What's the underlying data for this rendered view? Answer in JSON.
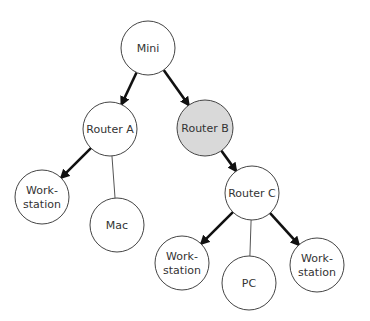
{
  "diagram": {
    "type": "network-tree",
    "colors": {
      "node_fill": "#ffffff",
      "highlight_fill": "#d9d9d9",
      "stroke": "#444444",
      "bold_edge": "#111111",
      "thin_edge": "#555555"
    },
    "nodes": [
      {
        "id": "mini",
        "lines": [
          "Mini"
        ],
        "cx": 148,
        "cy": 48,
        "r": 27,
        "highlight": false
      },
      {
        "id": "router-a",
        "lines": [
          "Router A"
        ],
        "cx": 110,
        "cy": 129,
        "r": 27,
        "highlight": false
      },
      {
        "id": "router-b",
        "lines": [
          "Router B"
        ],
        "cx": 205,
        "cy": 128,
        "r": 28,
        "highlight": true
      },
      {
        "id": "workstation-1",
        "lines": [
          "Work-",
          "station"
        ],
        "cx": 42,
        "cy": 197,
        "r": 27,
        "highlight": false
      },
      {
        "id": "mac",
        "lines": [
          "Mac"
        ],
        "cx": 117,
        "cy": 225,
        "r": 27,
        "highlight": false
      },
      {
        "id": "router-c",
        "lines": [
          "Router C"
        ],
        "cx": 252,
        "cy": 193,
        "r": 27,
        "highlight": false
      },
      {
        "id": "workstation-2",
        "lines": [
          "Work-",
          "station"
        ],
        "cx": 182,
        "cy": 263,
        "r": 27,
        "highlight": false
      },
      {
        "id": "pc",
        "lines": [
          "PC"
        ],
        "cx": 249,
        "cy": 283,
        "r": 27,
        "highlight": false
      },
      {
        "id": "workstation-3",
        "lines": [
          "Work-",
          "station"
        ],
        "cx": 317,
        "cy": 265,
        "r": 27,
        "highlight": false
      }
    ],
    "edges": [
      {
        "from": "mini",
        "to": "router-a",
        "style": "bold-arrow"
      },
      {
        "from": "mini",
        "to": "router-b",
        "style": "bold-arrow"
      },
      {
        "from": "router-a",
        "to": "workstation-1",
        "style": "bold-arrow"
      },
      {
        "from": "router-a",
        "to": "mac",
        "style": "thin"
      },
      {
        "from": "router-b",
        "to": "router-c",
        "style": "bold-arrow"
      },
      {
        "from": "router-c",
        "to": "workstation-2",
        "style": "bold-arrow"
      },
      {
        "from": "router-c",
        "to": "pc",
        "style": "thin"
      },
      {
        "from": "router-c",
        "to": "workstation-3",
        "style": "bold-arrow"
      }
    ]
  }
}
